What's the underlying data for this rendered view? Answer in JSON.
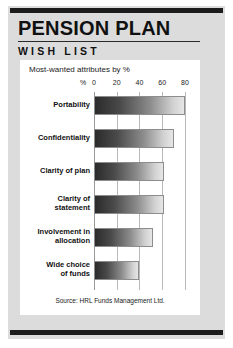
{
  "header": {
    "title": "PENSION PLAN",
    "subtitle": "WISH LIST"
  },
  "card": {
    "chart_title": "Most-wanted attributes by %",
    "source": "Source: HRL Funds Management Ltd."
  },
  "axis": {
    "unit_label": "%",
    "ticks": [
      "0",
      "20",
      "40",
      "60",
      "80"
    ]
  },
  "colors": {
    "panel": "#dcdcdc",
    "rule": "#1c1c1c",
    "card": "#ffffff",
    "bar_dark": "#2b2b2b",
    "bar_light": "#e6e6e6",
    "gridline": "#b9b9b9",
    "text": "#111111"
  },
  "chart_data": {
    "type": "bar",
    "orientation": "horizontal",
    "title": "Most-wanted attributes by %",
    "xlabel": "%",
    "ylabel": "",
    "xlim": [
      0,
      88
    ],
    "xticks": [
      0,
      20,
      40,
      60,
      80
    ],
    "grid": true,
    "legend": false,
    "source": "Source: HRL Funds Management Ltd.",
    "categories": [
      "Portability",
      "Confidentiality",
      "Clarity of plan",
      "Clarity of statement",
      "Involvement in allocation",
      "Wide choice of funds"
    ],
    "values": [
      80,
      70,
      62,
      62,
      52,
      40
    ],
    "bars": [
      {
        "label": "Portability",
        "label_lines": [
          "Portability"
        ],
        "value": 80
      },
      {
        "label": "Confidentiality",
        "label_lines": [
          "Confidentiality"
        ],
        "value": 70
      },
      {
        "label": "Clarity of plan",
        "label_lines": [
          "Clarity of plan"
        ],
        "value": 62
      },
      {
        "label": "Clarity of statement",
        "label_lines": [
          "Clarity of",
          "statement"
        ],
        "value": 62
      },
      {
        "label": "Involvement in allocation",
        "label_lines": [
          "Involvement in",
          "allocation"
        ],
        "value": 52
      },
      {
        "label": "Wide choice of funds",
        "label_lines": [
          "Wide choice",
          "of funds"
        ],
        "value": 40
      }
    ]
  }
}
